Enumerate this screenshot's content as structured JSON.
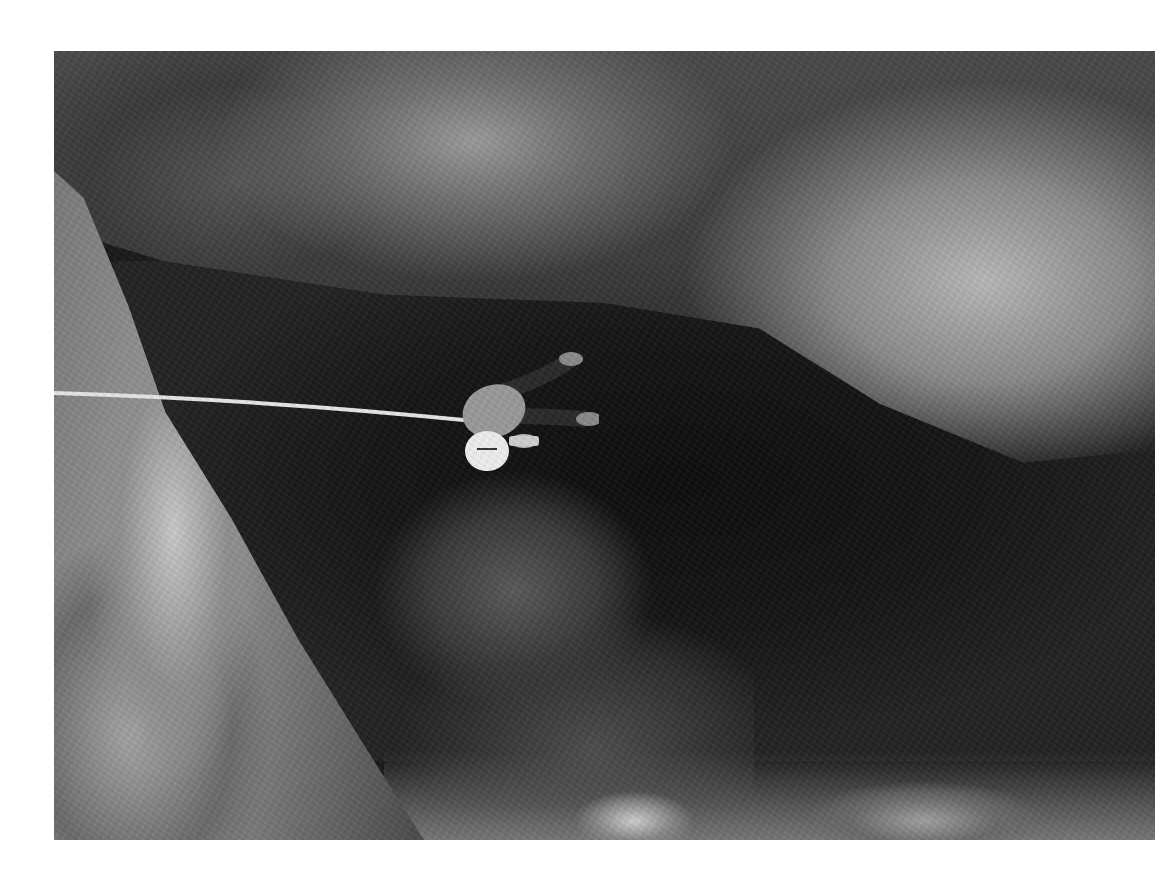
{
  "page": {
    "background_color": "#ffffff"
  },
  "photo": {
    "subject": "Climber rappelling on a rope into a dark cave, viewed from above",
    "style": "black-and-white photograph",
    "elements": [
      "rock overhang",
      "cave interior",
      "left rock wall",
      "rope",
      "climber with white helmet",
      "boulders on cave floor"
    ],
    "colors": {
      "rock_light": "#b8b8b8",
      "rock_mid": "#7a7a7a",
      "cave_dark": "#0d0d0d",
      "rope": "#e6e6e6",
      "helmet": "#eeeeee"
    }
  }
}
